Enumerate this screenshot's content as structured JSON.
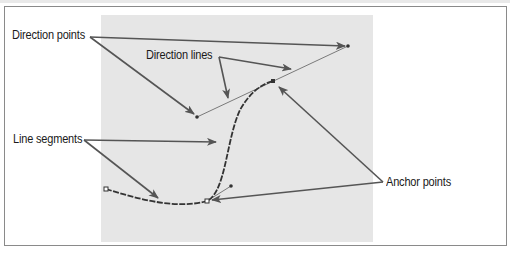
{
  "diagram": {
    "type": "bezier-path-anatomy",
    "labels": {
      "direction_points": "Direction points",
      "direction_lines": "Direction lines",
      "line_segments": "Line segments",
      "anchor_points": "Anchor points"
    },
    "colors": {
      "panel": "#e6e6e6",
      "frame": "#8a8a8a",
      "arrow": "#555555",
      "curve": "#333333",
      "text": "#1a1a1a"
    },
    "points": {
      "direction_point_upper_left": [
        197,
        117
      ],
      "direction_point_upper_right": [
        348,
        46
      ],
      "anchor_upper": [
        273,
        81
      ],
      "anchor_lower": [
        207,
        201
      ],
      "direction_point_lower": [
        231,
        186
      ],
      "path_start": [
        106,
        189
      ]
    }
  }
}
